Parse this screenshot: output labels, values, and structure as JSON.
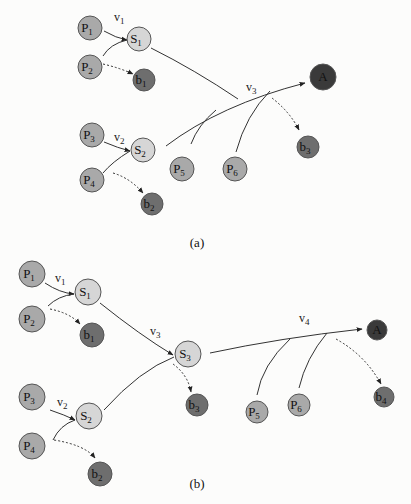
{
  "cropped_top_text": "",
  "colors": {
    "p_node": "#a9a9a9",
    "s_node": "#d6d6d6",
    "b_node": "#6e6e6e",
    "a_node": "#3a3a3a",
    "stroke": "#555555",
    "edge": "#333333"
  },
  "diagram_a": {
    "caption": "(a)",
    "nodes": [
      {
        "id": "P1",
        "main": "P",
        "sub": "1",
        "kind": "p",
        "x": 90,
        "y": 28,
        "r": 12
      },
      {
        "id": "P2",
        "main": "P",
        "sub": "2",
        "kind": "p",
        "x": 90,
        "y": 67,
        "r": 12
      },
      {
        "id": "S1",
        "main": "S",
        "sub": "1",
        "kind": "s",
        "x": 139,
        "y": 39,
        "r": 12
      },
      {
        "id": "b1",
        "main": "b",
        "sub": "1",
        "kind": "b",
        "x": 144,
        "y": 80,
        "r": 11
      },
      {
        "id": "P3",
        "main": "P",
        "sub": "3",
        "kind": "p",
        "x": 92,
        "y": 135,
        "r": 12
      },
      {
        "id": "P4",
        "main": "P",
        "sub": "4",
        "kind": "p",
        "x": 92,
        "y": 180,
        "r": 12
      },
      {
        "id": "S2",
        "main": "S",
        "sub": "2",
        "kind": "s",
        "x": 143,
        "y": 150,
        "r": 12
      },
      {
        "id": "b2",
        "main": "b",
        "sub": "2",
        "kind": "b",
        "x": 152,
        "y": 204,
        "r": 11
      },
      {
        "id": "P5",
        "main": "P",
        "sub": "5",
        "kind": "p",
        "x": 182,
        "y": 169,
        "r": 12
      },
      {
        "id": "P6",
        "main": "P",
        "sub": "6",
        "kind": "p",
        "x": 235,
        "y": 169,
        "r": 12
      },
      {
        "id": "A",
        "main": "A",
        "sub": "",
        "kind": "a",
        "x": 323,
        "y": 77,
        "r": 13
      },
      {
        "id": "b3",
        "main": "b",
        "sub": "3",
        "kind": "b",
        "x": 308,
        "y": 147,
        "r": 11
      }
    ],
    "edge_labels": [
      {
        "text": "v",
        "sub": "1",
        "x": 114,
        "y": 21
      },
      {
        "text": "v",
        "sub": "2",
        "x": 114,
        "y": 141
      },
      {
        "text": "v",
        "sub": "3",
        "x": 246,
        "y": 91
      }
    ]
  },
  "diagram_b": {
    "caption": "(b)",
    "nodes": [
      {
        "id": "P1",
        "main": "P",
        "sub": "1",
        "kind": "p",
        "x": 32,
        "y": 274,
        "r": 13
      },
      {
        "id": "P2",
        "main": "P",
        "sub": "2",
        "kind": "p",
        "x": 32,
        "y": 319,
        "r": 13
      },
      {
        "id": "S1",
        "main": "S",
        "sub": "1",
        "kind": "s",
        "x": 88,
        "y": 292,
        "r": 13
      },
      {
        "id": "b1",
        "main": "b",
        "sub": "1",
        "kind": "b",
        "x": 92,
        "y": 335,
        "r": 12
      },
      {
        "id": "S3",
        "main": "S",
        "sub": "3",
        "kind": "s",
        "x": 188,
        "y": 354,
        "r": 13
      },
      {
        "id": "b3",
        "main": "b",
        "sub": "3",
        "kind": "b",
        "x": 197,
        "y": 405,
        "r": 11
      },
      {
        "id": "P3",
        "main": "P",
        "sub": "3",
        "kind": "p",
        "x": 32,
        "y": 397,
        "r": 13
      },
      {
        "id": "P4",
        "main": "P",
        "sub": "4",
        "kind": "p",
        "x": 32,
        "y": 446,
        "r": 13
      },
      {
        "id": "S2",
        "main": "S",
        "sub": "2",
        "kind": "s",
        "x": 89,
        "y": 416,
        "r": 13
      },
      {
        "id": "b2",
        "main": "b",
        "sub": "2",
        "kind": "b",
        "x": 100,
        "y": 474,
        "r": 12
      },
      {
        "id": "P5",
        "main": "P",
        "sub": "5",
        "kind": "p",
        "x": 257,
        "y": 412,
        "r": 11
      },
      {
        "id": "P6",
        "main": "P",
        "sub": "6",
        "kind": "p",
        "x": 299,
        "y": 405,
        "r": 11
      },
      {
        "id": "A",
        "main": "A",
        "sub": "",
        "kind": "a",
        "x": 377,
        "y": 330,
        "r": 10
      },
      {
        "id": "b4",
        "main": "b",
        "sub": "4",
        "kind": "b",
        "x": 384,
        "y": 397,
        "r": 10
      }
    ],
    "edge_labels": [
      {
        "text": "v",
        "sub": "1",
        "x": 55,
        "y": 282
      },
      {
        "text": "v",
        "sub": "2",
        "x": 57,
        "y": 406
      },
      {
        "text": "v",
        "sub": "3",
        "x": 150,
        "y": 335
      },
      {
        "text": "v",
        "sub": "4",
        "x": 299,
        "y": 322
      }
    ]
  }
}
